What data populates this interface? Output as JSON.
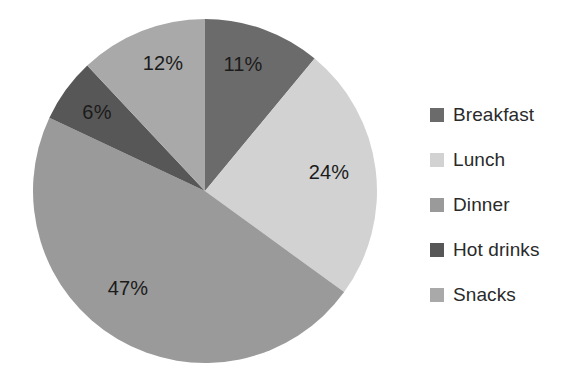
{
  "chart_data": {
    "type": "pie",
    "title": "",
    "categories": [
      "Breakfast",
      "Lunch",
      "Dinner",
      "Hot drinks",
      "Snacks"
    ],
    "values": [
      11,
      24,
      47,
      6,
      12
    ],
    "value_unit": "%",
    "data_labels": [
      "11%",
      "24%",
      "47%",
      "6%",
      "12%"
    ],
    "colors": [
      "#6b6b6b",
      "#d2d2d2",
      "#9a9a9a",
      "#575757",
      "#a9a9a9"
    ],
    "legend_position": "right",
    "grid": false,
    "start_angle_deg": 0,
    "direction": "clockwise",
    "slices": [
      {
        "label": "Breakfast",
        "value": 11,
        "data_label": "11%",
        "color": "#6b6b6b",
        "label_x": 243,
        "label_y": 64
      },
      {
        "label": "Lunch",
        "value": 24,
        "data_label": "24%",
        "color": "#d2d2d2",
        "label_x": 329,
        "label_y": 172
      },
      {
        "label": "Dinner",
        "value": 47,
        "data_label": "47%",
        "color": "#9a9a9a",
        "label_x": 128,
        "label_y": 288
      },
      {
        "label": "Hot drinks",
        "value": 6,
        "data_label": "6%",
        "color": "#575757",
        "label_x": 97,
        "label_y": 112
      },
      {
        "label": "Snacks",
        "value": 12,
        "data_label": "12%",
        "color": "#a9a9a9",
        "label_x": 163,
        "label_y": 63
      }
    ]
  },
  "legend": {
    "items": [
      {
        "label": "Breakfast",
        "color": "#6b6b6b",
        "swatch_name": "legend-swatch-breakfast"
      },
      {
        "label": "Lunch",
        "color": "#d2d2d2",
        "swatch_name": "legend-swatch-lunch"
      },
      {
        "label": "Dinner",
        "color": "#9a9a9a",
        "swatch_name": "legend-swatch-dinner"
      },
      {
        "label": "Hot drinks",
        "color": "#575757",
        "swatch_name": "legend-swatch-hot-drinks"
      },
      {
        "label": "Snacks",
        "color": "#a9a9a9",
        "swatch_name": "legend-swatch-snacks"
      }
    ]
  },
  "geometry": {
    "center_x": 205,
    "center_y": 191,
    "radius": 172
  }
}
